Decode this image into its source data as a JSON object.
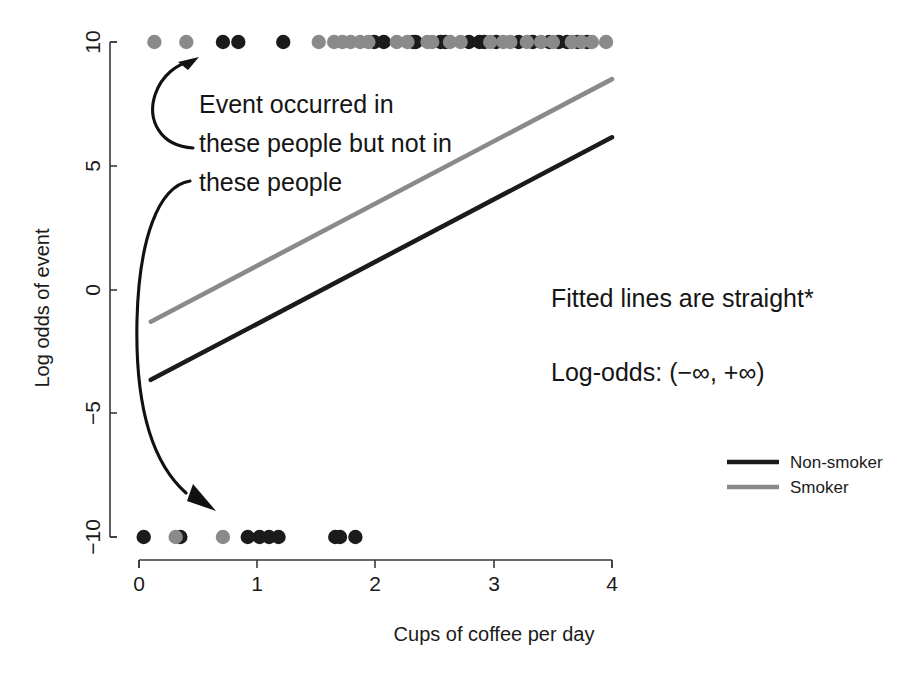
{
  "chart_data": {
    "type": "scatter",
    "title": "",
    "xlabel": "Cups of coffee per day",
    "ylabel": "Log odds of event",
    "xlim": [
      0,
      4
    ],
    "ylim": [
      -10,
      10
    ],
    "xticks": [
      0,
      1,
      2,
      3,
      4
    ],
    "xtick_labels": [
      "0",
      "1",
      "2",
      "3",
      "4"
    ],
    "yticks": [
      10,
      5,
      0,
      -5,
      -10
    ],
    "ytick_labels": [
      "10",
      "5",
      "0",
      "-5",
      "-10"
    ],
    "grid": false,
    "legend_position": "right-middle",
    "legend": [
      {
        "name": "Non-smoker",
        "color": "#1b1b1b"
      },
      {
        "name": "Smoker",
        "color": "#8a8a8a"
      }
    ],
    "series": [
      {
        "name": "Non-smoker fitted line",
        "type": "line",
        "color": "#1b1b1b",
        "x": [
          0.1,
          4.0
        ],
        "y": [
          -3.65,
          6.15
        ]
      },
      {
        "name": "Smoker fitted line",
        "type": "line",
        "color": "#8a8a8a",
        "x": [
          0.1,
          4.0
        ],
        "y": [
          -1.3,
          8.5
        ]
      },
      {
        "name": "Event occurred (y = 10), Non-smoker",
        "type": "scatter",
        "color": "#1b1b1b",
        "y_value": 10,
        "x": [
          0.71,
          0.84,
          1.22,
          1.99,
          2.07,
          2.32,
          2.34,
          2.55,
          2.59,
          2.79,
          2.88,
          2.92,
          3.02,
          3.21,
          3.33,
          3.47,
          3.55,
          3.62,
          3.71,
          3.79
        ]
      },
      {
        "name": "Event occurred (y = 10), Smoker",
        "type": "scatter",
        "color": "#8a8a8a",
        "y_value": 10,
        "x": [
          0.13,
          0.4,
          1.52,
          1.65,
          1.72,
          1.79,
          1.87,
          1.94,
          2.18,
          2.27,
          2.44,
          2.48,
          2.63,
          2.72,
          2.97,
          3.08,
          3.14,
          3.28,
          3.4,
          3.5,
          3.66,
          3.74,
          3.83,
          3.95
        ]
      },
      {
        "name": "No event (y = -10), Non-smoker",
        "type": "scatter",
        "color": "#1b1b1b",
        "y_value": -10,
        "x": [
          0.04,
          0.35,
          0.92,
          1.02,
          1.1,
          1.18,
          1.66,
          1.7,
          1.83
        ]
      },
      {
        "name": "No event (y = -10), Smoker",
        "type": "scatter",
        "color": "#8a8a8a",
        "y_value": -10,
        "x": [
          0.31,
          0.71
        ]
      }
    ],
    "annotations": [
      {
        "id": "event-note",
        "lines": [
          "Event occurred in",
          "these people but not in",
          "these people"
        ],
        "x": 0.45,
        "y": 7.2
      },
      {
        "id": "fitted-note",
        "lines": [
          "Fitted lines are straight*"
        ],
        "x": 2.2,
        "y": 0.3
      },
      {
        "id": "logodds-note",
        "lines": [
          "Log-odds: (−∞, +∞)"
        ],
        "x": 2.2,
        "y": -2.8
      }
    ]
  },
  "annotations": {
    "event_line1": "Event occurred in",
    "event_line2": "these people but not in",
    "event_line3": "these people",
    "fitted_lines": "Fitted lines are straight*",
    "log_odds_range": "Log-odds: (−∞, +∞)"
  },
  "axes": {
    "x_title": "Cups of coffee per day",
    "y_title": "Log odds of event",
    "x_labels": [
      "0",
      "1",
      "2",
      "3",
      "4"
    ],
    "y_labels": [
      "10",
      "5",
      "0",
      "−10",
      "−5"
    ],
    "y_label_10": "10",
    "y_label_5": "5",
    "y_label_0": "0",
    "y_label_neg5": "−5",
    "y_label_neg10": "−10"
  },
  "legend": {
    "non_smoker": "Non-smoker",
    "smoker": "Smoker"
  },
  "colors": {
    "black": "#1b1b1b",
    "gray": "#8a8a8a",
    "axis": "#3a3a3a",
    "background": "#ffffff"
  }
}
